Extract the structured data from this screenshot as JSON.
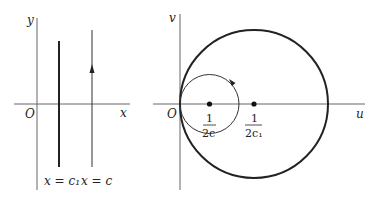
{
  "left_panel": {
    "y_axis_label": "y",
    "x_axis_label": "x",
    "origin_label": "O",
    "line_c1_label": "x = c₁",
    "line_c_label": "x = c"
  },
  "right_panel": {
    "v_axis_label": "v",
    "u_axis_label": "u",
    "origin_label": "O",
    "small_center_num": "1",
    "small_center_den": "2c",
    "large_center_num": "1",
    "large_center_den": "2c₁"
  },
  "colors": {
    "stroke": "#222222",
    "axis": "#555555"
  }
}
